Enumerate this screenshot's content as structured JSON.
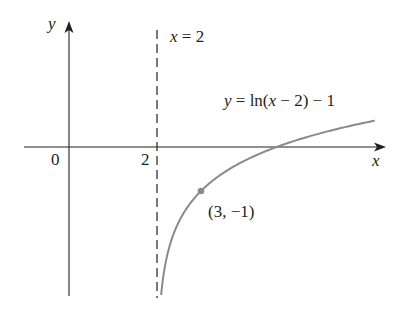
{
  "axes": {
    "x_label": "x",
    "y_label": "y",
    "origin_label": "0",
    "tick_2_label": "2"
  },
  "asymptote": {
    "label": "x = 2",
    "x_value": 2
  },
  "curve": {
    "label": "y = ln(x − 2) − 1",
    "color": "#8a8a8a"
  },
  "point": {
    "label": "(3, −1)",
    "x": 3,
    "y": -1,
    "color": "#8a8a8a"
  },
  "chart_data": {
    "type": "line",
    "title": "",
    "xlabel": "x",
    "ylabel": "y",
    "function": "y = ln(x - 2) - 1",
    "series": [
      {
        "name": "y = ln(x − 2) − 1",
        "x": [
          2.094,
          2.2,
          2.5,
          3,
          3.5,
          4,
          4.718,
          5.5,
          6.2,
          6.95
        ],
        "y": [
          -3.36,
          -2.61,
          -1.69,
          -1.0,
          -0.59,
          -0.31,
          0.0,
          0.25,
          0.44,
          0.6
        ]
      }
    ],
    "annotations": [
      {
        "text": "x = 2",
        "type": "vertical asymptote (dashed)",
        "x": 2
      },
      {
        "text": "(3, −1)",
        "type": "point",
        "x": 3,
        "y": -1
      },
      {
        "text": "y = ln(x − 2) − 1",
        "type": "curve label"
      }
    ],
    "tick_labels": {
      "x": [
        "0",
        "2"
      ]
    },
    "xlim": [
      -1.0,
      7.4
    ],
    "ylim": [
      -3.4,
      2.4
    ],
    "grid": false
  }
}
